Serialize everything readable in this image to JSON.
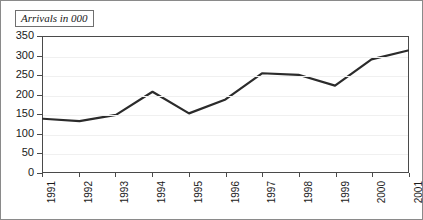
{
  "chart_data": {
    "type": "line",
    "title": "Arrivals in 000",
    "xlabel": "",
    "ylabel": "",
    "categories": [
      "1991",
      "1992",
      "1993",
      "1994",
      "1995",
      "1996",
      "1997",
      "1998",
      "1999",
      "2000",
      "2001"
    ],
    "values": [
      138,
      132,
      148,
      208,
      152,
      188,
      256,
      252,
      224,
      292,
      315
    ],
    "series": [
      {
        "name": "Arrivals in 000",
        "values": [
          138,
          132,
          148,
          208,
          152,
          188,
          256,
          252,
          224,
          292,
          315
        ]
      }
    ],
    "ylim": [
      0,
      350
    ],
    "y_ticks": [
      0,
      50,
      100,
      150,
      200,
      250,
      300,
      350
    ],
    "y_tick_labels": [
      "0",
      "50",
      "100",
      "150",
      "200",
      "250",
      "300",
      "350"
    ],
    "x_tick_labels": [
      "1991",
      "1992",
      "1993",
      "1994",
      "1995",
      "1996",
      "1997",
      "1998",
      "1999",
      "2000",
      "2001"
    ],
    "grid": true,
    "grid_axis": "y",
    "legend": false,
    "legend_position": "none",
    "line_color": "#2b2b2b",
    "axis_color": "#4a4a4a",
    "grid_color": "#f0f0f0",
    "background_color": "#ffffff",
    "x_label_rotation": "90"
  }
}
